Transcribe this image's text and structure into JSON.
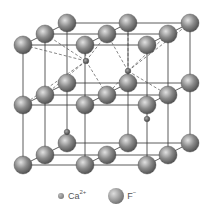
{
  "diagram": {
    "colors": {
      "frame": "#333333",
      "dashed": "#555555",
      "sphere_light": "#dddddd",
      "sphere_dark": "#666666"
    },
    "f_ions": [
      [
        23,
        45
      ],
      [
        45,
        34
      ],
      [
        67,
        23
      ],
      [
        85,
        45
      ],
      [
        107,
        34
      ],
      [
        128,
        23
      ],
      [
        147,
        45
      ],
      [
        168,
        34
      ],
      [
        190,
        23
      ],
      [
        23,
        105
      ],
      [
        45,
        95
      ],
      [
        67,
        83
      ],
      [
        85,
        105
      ],
      [
        107,
        95
      ],
      [
        128,
        83
      ],
      [
        147,
        105
      ],
      [
        168,
        95
      ],
      [
        190,
        83
      ],
      [
        23,
        165
      ],
      [
        45,
        155
      ],
      [
        67,
        143
      ],
      [
        85,
        165
      ],
      [
        107,
        155
      ],
      [
        128,
        143
      ],
      [
        147,
        165
      ],
      [
        168,
        155
      ],
      [
        190,
        143
      ]
    ],
    "ca_ions": [
      [
        86,
        61
      ],
      [
        128,
        71
      ],
      [
        67,
        132
      ],
      [
        147,
        119
      ]
    ]
  },
  "legend": {
    "ca_label": "Ca",
    "ca_charge": "2+",
    "f_label": "F",
    "f_charge": "−"
  }
}
